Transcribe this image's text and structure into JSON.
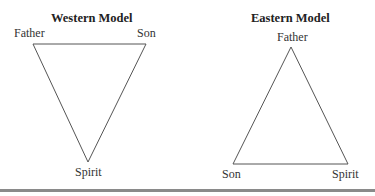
{
  "diagrams": [
    {
      "title": "Western Model",
      "vertices": {
        "top_left": "Father",
        "top_right": "Son",
        "bottom": "Spirit"
      },
      "orientation": "inverted"
    },
    {
      "title": "Eastern Model",
      "vertices": {
        "top": "Father",
        "bottom_left": "Son",
        "bottom_right": "Spirit"
      },
      "orientation": "upright"
    }
  ],
  "colors": {
    "line": "#555555",
    "text": "#222222",
    "rule": "#8a8a8a"
  }
}
